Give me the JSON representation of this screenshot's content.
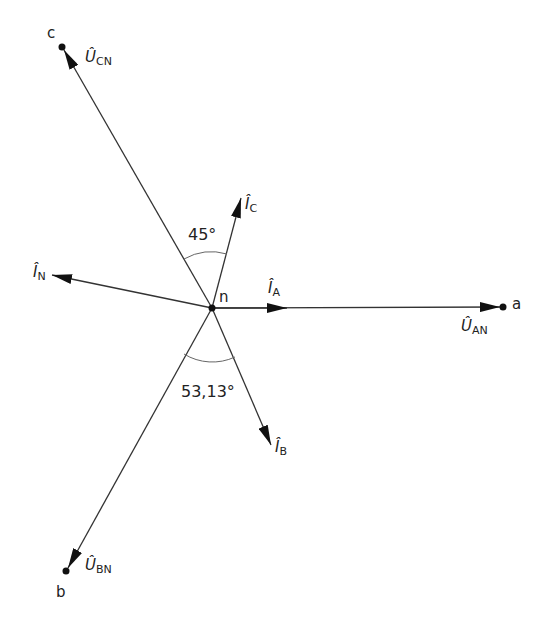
{
  "diagram": {
    "type": "phasor-diagram",
    "center": {
      "label": "n"
    },
    "nodes": {
      "a": "a",
      "b": "b",
      "c": "c"
    },
    "voltages": {
      "an": {
        "main": "Û",
        "sub": "AN"
      },
      "bn": {
        "main": "Û",
        "sub": "BN"
      },
      "cn": {
        "main": "Û",
        "sub": "CN"
      }
    },
    "currents": {
      "a": {
        "main": "Î",
        "sub": "A"
      },
      "b": {
        "main": "Î",
        "sub": "B"
      },
      "c": {
        "main": "Î",
        "sub": "C"
      },
      "n": {
        "main": "Î",
        "sub": "N"
      }
    },
    "angles": {
      "upper": "45°",
      "lower": "53,13°"
    },
    "colors": {
      "line": "#222222",
      "arc": "#555555"
    }
  }
}
